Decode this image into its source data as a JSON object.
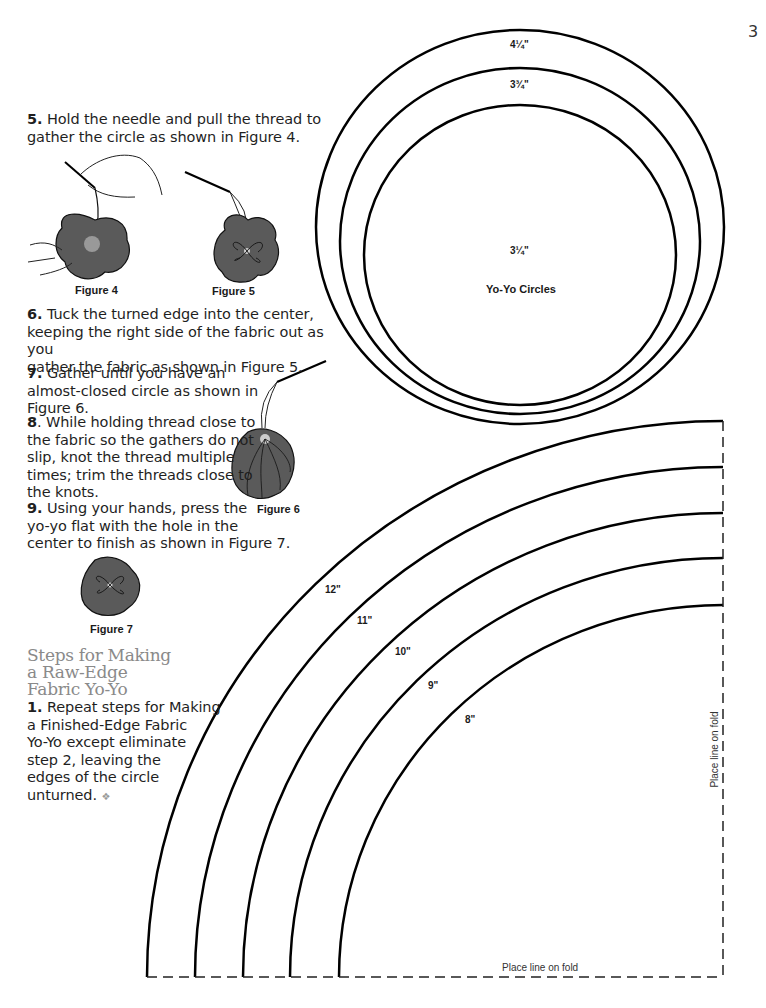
{
  "page_number": "3",
  "steps": [
    {
      "num": "5.",
      "text": "Hold the needle and pull the thread to gather the circle as shown in Figure 4."
    },
    {
      "num": "6.",
      "text": "Tuck the turned edge into the center, keeping the right side of the fabric out as you gather the fabric as shown in Figure 5."
    },
    {
      "num": "7.",
      "text": "Gather until you have an almost-closed circle as shown in Figure 6."
    },
    {
      "num": "8",
      "text": ". While holding thread close to the fabric so the gathers do not slip, knot the thread multiple times; trim the threads close to the knots."
    },
    {
      "num": "9.",
      "text": "Using your hands, press the yo-yo flat with the hole in the center to finish as shown in Figure 7."
    }
  ],
  "lines": {
    "s5": [
      "Hold the needle and pull the thread to",
      "gather the circle as shown in Figure 4."
    ],
    "s6": [
      "Tuck the turned edge into the center,",
      "keeping the right side of the fabric out as you",
      "gather the fabric as shown in Figure 5."
    ],
    "s7": [
      "Gather until you have an",
      "almost-closed circle as shown in",
      "Figure 6."
    ],
    "s8": [
      ". While holding thread close to",
      "the fabric so the gathers do not",
      "slip, knot the thread multiple",
      "times; trim the threads close to",
      "the knots."
    ],
    "s9": [
      "Using your hands, press the",
      "yo-yo flat with the hole in the",
      "center to finish as shown in Figure 7."
    ],
    "raw1": [
      "Repeat steps for Making",
      "a Finished-Edge Fabric",
      "Yo-Yo except eliminate",
      "step 2, leaving the",
      "edges of the circle",
      "unturned."
    ]
  },
  "figures": {
    "fig4": "Figure 4",
    "fig5": "Figure 5",
    "fig6": "Figure 6",
    "fig7": "Figure 7"
  },
  "section": {
    "heading_lines": [
      "Steps for Making",
      "a Raw-Edge",
      "Fabric Yo-Yo"
    ],
    "step_num": "1.",
    "end_mark": "❖"
  },
  "yoyo_circles": {
    "title": "Yo-Yo Circles",
    "labels": [
      "4¼\"",
      "3¾\"",
      "3¼\""
    ]
  },
  "arc_pattern": {
    "labels": [
      "12\"",
      "11\"",
      "10\"",
      "9\"",
      "8\""
    ],
    "fold_label_bottom": "Place line on fold",
    "fold_label_side": "Place line on fold"
  },
  "colors": {
    "heading": "#8a8a8a",
    "fabric_fill": "#5a5a5a",
    "line": "#000000"
  }
}
